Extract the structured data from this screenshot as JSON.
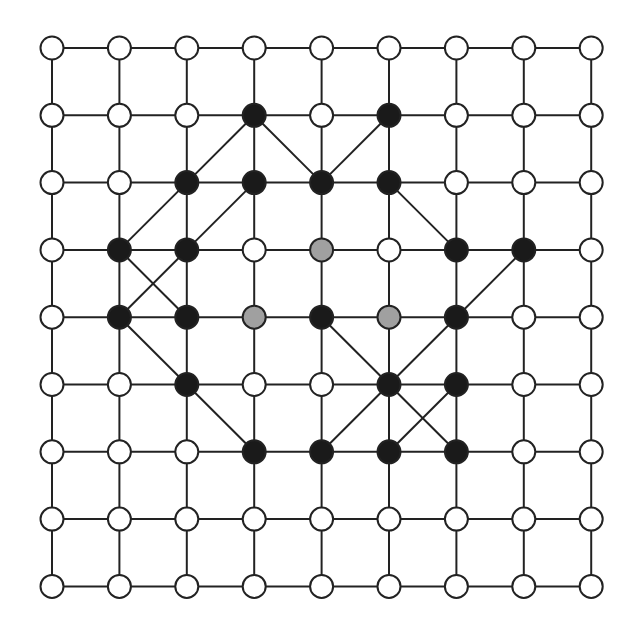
{
  "diagram": {
    "type": "lattice-graph",
    "rows": 9,
    "cols": 9,
    "origin": [
      52,
      48
    ],
    "spacing": [
      67.4,
      67.3
    ],
    "node_radius": 11.5,
    "colors": {
      "white": "#ffffff",
      "black": "#1a1a1a",
      "gray": "#a0a0a0",
      "edge": "#222222"
    },
    "black_nodes": [
      [
        1,
        3
      ],
      [
        1,
        5
      ],
      [
        2,
        2
      ],
      [
        2,
        3
      ],
      [
        2,
        4
      ],
      [
        2,
        5
      ],
      [
        3,
        1
      ],
      [
        3,
        2
      ],
      [
        3,
        6
      ],
      [
        3,
        7
      ],
      [
        4,
        1
      ],
      [
        4,
        2
      ],
      [
        4,
        4
      ],
      [
        4,
        6
      ],
      [
        5,
        2
      ],
      [
        5,
        5
      ],
      [
        5,
        6
      ],
      [
        6,
        3
      ],
      [
        6,
        4
      ],
      [
        6,
        5
      ],
      [
        6,
        6
      ]
    ],
    "gray_nodes": [
      [
        3,
        4
      ],
      [
        4,
        3
      ],
      [
        4,
        5
      ]
    ],
    "diagonal_edges": [
      [
        [
          1,
          3
        ],
        [
          2,
          4
        ]
      ],
      [
        [
          1,
          5
        ],
        [
          2,
          4
        ]
      ],
      [
        [
          1,
          3
        ],
        [
          2,
          2
        ]
      ],
      [
        [
          2,
          2
        ],
        [
          3,
          1
        ]
      ],
      [
        [
          2,
          3
        ],
        [
          3,
          2
        ]
      ],
      [
        [
          3,
          2
        ],
        [
          4,
          1
        ]
      ],
      [
        [
          3,
          1
        ],
        [
          4,
          2
        ]
      ],
      [
        [
          4,
          1
        ],
        [
          5,
          2
        ]
      ],
      [
        [
          5,
          2
        ],
        [
          6,
          3
        ]
      ],
      [
        [
          2,
          5
        ],
        [
          3,
          6
        ]
      ],
      [
        [
          3,
          7
        ],
        [
          4,
          6
        ]
      ],
      [
        [
          4,
          6
        ],
        [
          5,
          5
        ]
      ],
      [
        [
          5,
          5
        ],
        [
          6,
          4
        ]
      ],
      [
        [
          4,
          4
        ],
        [
          5,
          5
        ]
      ],
      [
        [
          5,
          5
        ],
        [
          6,
          6
        ]
      ],
      [
        [
          5,
          6
        ],
        [
          6,
          5
        ]
      ]
    ]
  }
}
